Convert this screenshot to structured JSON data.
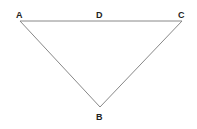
{
  "diagram": {
    "type": "triangle",
    "vertices": [
      {
        "label": "A",
        "x": 20,
        "y": 21
      },
      {
        "label": "C",
        "x": 182,
        "y": 21
      },
      {
        "label": "B",
        "x": 100,
        "y": 107
      }
    ],
    "points": [
      {
        "label": "D",
        "on_segment": "AC"
      }
    ],
    "labels": {
      "a": "A",
      "b": "B",
      "c": "C",
      "d": "D"
    },
    "stroke_color": "#888888"
  }
}
